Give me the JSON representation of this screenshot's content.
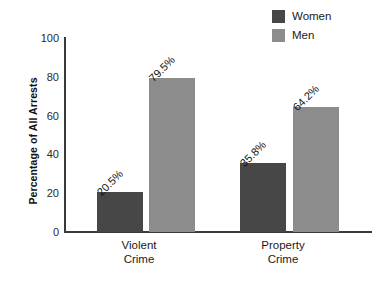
{
  "chart_data": {
    "type": "bar",
    "title": "",
    "xlabel": "",
    "ylabel": "Percentage of All Arrests",
    "ylim": [
      0,
      100
    ],
    "yticks": [
      0,
      20,
      40,
      60,
      80,
      100
    ],
    "grid": false,
    "legend_position": "top-right",
    "categories": [
      "Violent Crime",
      "Property Crime"
    ],
    "category_lines": [
      [
        "Violent",
        "Crime"
      ],
      [
        "Property",
        "Crime"
      ]
    ],
    "series": [
      {
        "name": "Women",
        "color": "#474747",
        "values": [
          20.5,
          35.8
        ],
        "labels": [
          "20.5%",
          "35.8%"
        ]
      },
      {
        "name": "Men",
        "color": "#8c8c8c",
        "values": [
          79.5,
          64.2
        ],
        "labels": [
          "79.5%",
          "64.2%"
        ]
      }
    ]
  },
  "legend": {
    "items": [
      {
        "label": "Women",
        "color": "#474747"
      },
      {
        "label": "Men",
        "color": "#8c8c8c"
      }
    ]
  },
  "axes": {
    "y_title": "Percentage of All Arrests",
    "y_tick_labels": [
      "100",
      "80",
      "60",
      "40",
      "20",
      "0"
    ]
  },
  "bars": [
    {
      "name": "violent-women",
      "value_label": "20.5%"
    },
    {
      "name": "violent-men",
      "value_label": "79.5%"
    },
    {
      "name": "property-women",
      "value_label": "35.8%"
    },
    {
      "name": "property-men",
      "value_label": "64.2%"
    }
  ],
  "categories": [
    {
      "line1": "Violent",
      "line2": "Crime"
    },
    {
      "line1": "Property",
      "line2": "Crime"
    }
  ]
}
